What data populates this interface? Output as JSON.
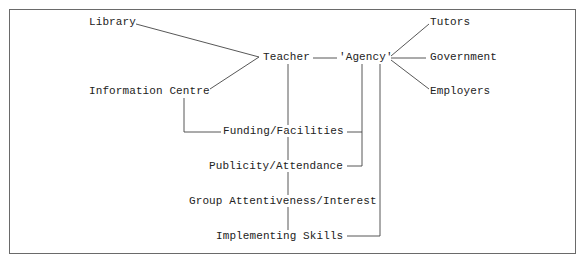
{
  "diagram": {
    "nodes": {
      "library": "Library",
      "information_centre": "Information Centre",
      "teacher": "Teacher",
      "agency": "'Agency'",
      "tutors": "Tutors",
      "government": "Government",
      "employers": "Employers",
      "funding_facilities": "Funding/Facilities",
      "publicity_attendance": "Publicity/Attendance",
      "group_attentiveness": "Group Attentiveness/Interest",
      "implementing_skills": "Implementing Skills"
    },
    "edges": [
      [
        "Library",
        "Teacher"
      ],
      [
        "Information Centre",
        "Teacher"
      ],
      [
        "Teacher",
        "'Agency'"
      ],
      [
        "'Agency'",
        "Tutors"
      ],
      [
        "'Agency'",
        "Government"
      ],
      [
        "'Agency'",
        "Employers"
      ],
      [
        "Teacher",
        "Funding/Facilities"
      ],
      [
        "Information Centre",
        "Funding/Facilities"
      ],
      [
        "'Agency'",
        "Funding/Facilities"
      ],
      [
        "'Agency'",
        "Publicity/Attendance"
      ],
      [
        "Funding/Facilities",
        "Publicity/Attendance"
      ],
      [
        "Publicity/Attendance",
        "Group Attentiveness/Interest"
      ],
      [
        "Group Attentiveness/Interest",
        "Implementing Skills"
      ],
      [
        "'Agency'",
        "Implementing Skills"
      ]
    ]
  }
}
